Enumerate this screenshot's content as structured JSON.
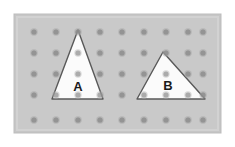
{
  "figure": {
    "canvas": {
      "width": 235,
      "height": 147
    },
    "outer_margin_color": "#ffffff",
    "board": {
      "x": 14,
      "y": 14,
      "width": 207,
      "height": 119,
      "fill": "#c6c6c6",
      "inner_highlight": "#d2d2d2",
      "border_color": "#bdbdbd"
    },
    "peg_grid": {
      "columns": 9,
      "rows": 5,
      "x_positions": [
        34,
        56,
        78,
        100,
        122,
        144,
        166,
        188,
        203
      ],
      "y_positions": [
        32,
        53,
        74,
        95,
        120
      ],
      "dot_radius": 2.6,
      "dot_fill": "#8e8e8e",
      "dot_ring": "#b4b4b4"
    },
    "shapes": [
      {
        "name": "triangle-a",
        "label": "A",
        "fill": "#fbfbfb",
        "stroke": "#595959",
        "stroke_width": 1.4,
        "points": "78,30 52,99 103,99",
        "label_x": 78,
        "label_y": 88
      },
      {
        "name": "triangle-b",
        "label": "B",
        "fill": "#fbfbfb",
        "stroke": "#595959",
        "stroke_width": 1.4,
        "points": "163,52 137,99 205,99",
        "label_x": 168,
        "label_y": 87
      }
    ]
  }
}
